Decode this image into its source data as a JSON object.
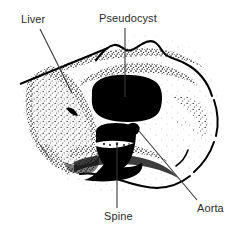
{
  "figure": {
    "type": "medical-illustration",
    "modality": "ct-abdomen-axial",
    "background_color": "#ffffff",
    "ink_color": "#000000",
    "label_color": "#2b2b2b"
  },
  "labels": [
    {
      "id": "liver",
      "text": "Liver",
      "position": {
        "x": 21,
        "y": 13
      },
      "leader": {
        "x1": 40,
        "y1": 28,
        "x2": 72,
        "y2": 92
      }
    },
    {
      "id": "pseudocyst",
      "text": "Pseudocyst",
      "position": {
        "x": 99,
        "y": 12
      },
      "leader": {
        "x1": 125,
        "y1": 27,
        "x2": 125,
        "y2": 97
      }
    },
    {
      "id": "spine",
      "text": "Spine",
      "position": {
        "x": 104,
        "y": 210
      },
      "leader": {
        "x1": 117,
        "y1": 208,
        "x2": 117,
        "y2": 142
      }
    },
    {
      "id": "aorta",
      "text": "Aorta",
      "position": {
        "x": 197,
        "y": 202
      },
      "leader": {
        "x1": 198,
        "y1": 200,
        "x2": 139,
        "y2": 131
      }
    }
  ],
  "structures": [
    {
      "id": "body-outline",
      "name": "Abdominal wall outline",
      "tone": "line"
    },
    {
      "id": "liver-parenchyma",
      "name": "Liver",
      "tone": "stippled-gray"
    },
    {
      "id": "pseudocyst-mass",
      "name": "Pseudocyst",
      "tone": "solid-black"
    },
    {
      "id": "vertebral-body",
      "name": "Spine",
      "tone": "solid-black"
    },
    {
      "id": "aorta-vessel",
      "name": "Aorta",
      "tone": "solid-black"
    }
  ]
}
